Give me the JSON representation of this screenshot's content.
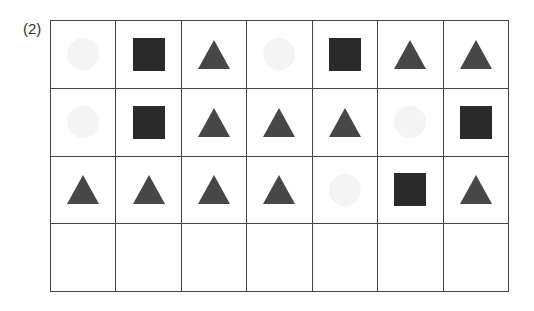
{
  "label": "(2)",
  "colors": {
    "square": "#2a2a2a",
    "triangle": "#474747",
    "circle": "#f4f4f4",
    "grid": "#444444"
  },
  "grid": {
    "rows": 4,
    "cols": 7,
    "cells": [
      [
        "circle",
        "square",
        "triangle",
        "circle",
        "square",
        "triangle",
        "triangle"
      ],
      [
        "circle",
        "square",
        "triangle",
        "triangle",
        "triangle",
        "circle",
        "square"
      ],
      [
        "triangle",
        "triangle",
        "triangle",
        "triangle",
        "circle",
        "square",
        "triangle"
      ],
      [
        "empty",
        "empty",
        "empty",
        "empty",
        "empty",
        "empty",
        "empty"
      ]
    ]
  }
}
